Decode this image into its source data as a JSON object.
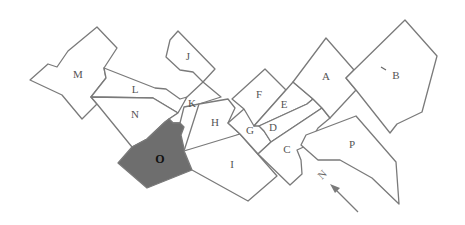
{
  "map": {
    "title": "District map",
    "highlighted_region": "O",
    "colors": {
      "stroke": "#7a7a7a",
      "fill": "#ffffff",
      "highlight_fill": "#6e6e6e",
      "label": "#555555",
      "highlight_label": "#111111"
    },
    "regions": [
      {
        "id": "A",
        "label": "A"
      },
      {
        "id": "B",
        "label": "B"
      },
      {
        "id": "C",
        "label": "C"
      },
      {
        "id": "D",
        "label": "D"
      },
      {
        "id": "E",
        "label": "E"
      },
      {
        "id": "F",
        "label": "F"
      },
      {
        "id": "G",
        "label": "G"
      },
      {
        "id": "H",
        "label": "H"
      },
      {
        "id": "I",
        "label": "I"
      },
      {
        "id": "J",
        "label": "J"
      },
      {
        "id": "K",
        "label": "K"
      },
      {
        "id": "L",
        "label": "L"
      },
      {
        "id": "M",
        "label": "M"
      },
      {
        "id": "N",
        "label": "N"
      },
      {
        "id": "O",
        "label": "O"
      },
      {
        "id": "P",
        "label": "P"
      }
    ],
    "compass": {
      "label": "N",
      "icon": "north-arrow-icon"
    }
  }
}
